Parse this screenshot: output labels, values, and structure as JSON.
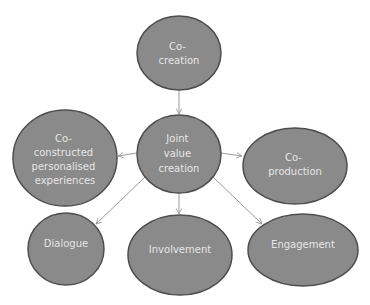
{
  "diagram": {
    "title": "",
    "colors": {
      "node_fill": "#8a8a8a",
      "node_border": "#4e4e4e",
      "node_text": "#e6e6e6",
      "edge": "#9a9a9a",
      "background": "#ffffff"
    },
    "nodes": [
      {
        "id": "co-creation",
        "lines": [
          "Co-",
          "creation"
        ],
        "cx": 179,
        "cy": 53,
        "rx": 42,
        "ry": 37
      },
      {
        "id": "joint-value-creation",
        "lines": [
          "Joint",
          "value",
          "creation"
        ],
        "cx": 179,
        "cy": 154,
        "rx": 42,
        "ry": 39
      },
      {
        "id": "co-constructed-personalised-experiences",
        "lines": [
          "Co-",
          "constructed",
          "personalised",
          "experiences"
        ],
        "cx": 65,
        "cy": 158,
        "rx": 52,
        "ry": 48
      },
      {
        "id": "co-production",
        "lines": [
          "Co-",
          "production"
        ],
        "cx": 295,
        "cy": 166,
        "rx": 52,
        "ry": 38
      },
      {
        "id": "dialogue",
        "lines": [
          "Dialogue"
        ],
        "cx": 66,
        "cy": 249,
        "rx": 38,
        "ry": 36
      },
      {
        "id": "involvement",
        "lines": [
          "Involvement"
        ],
        "cx": 180,
        "cy": 255,
        "rx": 52,
        "ry": 40
      },
      {
        "id": "engagement",
        "lines": [
          "Engagement"
        ],
        "cx": 303,
        "cy": 250,
        "rx": 55,
        "ry": 36
      }
    ],
    "edges": [
      {
        "from": "co-creation",
        "to": "joint-value-creation"
      },
      {
        "from": "joint-value-creation",
        "to": "co-constructed-personalised-experiences"
      },
      {
        "from": "joint-value-creation",
        "to": "co-production"
      },
      {
        "from": "joint-value-creation",
        "to": "dialogue"
      },
      {
        "from": "joint-value-creation",
        "to": "involvement"
      },
      {
        "from": "joint-value-creation",
        "to": "engagement"
      }
    ]
  }
}
